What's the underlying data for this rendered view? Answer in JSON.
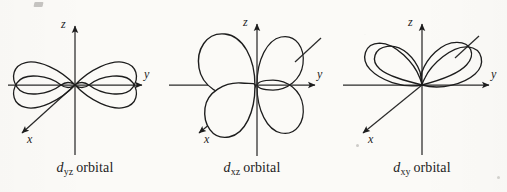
{
  "figure": {
    "kind": "d-orbital-shapes-diagram",
    "background_color": "#fbfaf7",
    "ink_color": "#1d1d1d",
    "panel_count": 3
  },
  "panels": [
    {
      "id": "dyz",
      "caption_symbol": "d",
      "caption_subscript": "yz",
      "caption_word": "orbital",
      "caption_full": "d yz orbital",
      "axes": [
        {
          "name": "z",
          "label": "z",
          "direction": "up",
          "arrow": true
        },
        {
          "name": "y",
          "label": "y",
          "direction": "right",
          "arrow": true
        },
        {
          "name": "x",
          "label": "x",
          "direction": "down-left",
          "arrow": true
        }
      ],
      "lobe_count": 4,
      "lobe_plane": "yz",
      "lobe_orientation": "diagonal between y and z axes"
    },
    {
      "id": "dxz",
      "caption_symbol": "d",
      "caption_subscript": "xz",
      "caption_word": "orbital",
      "caption_full": "d xz orbital",
      "axes": [
        {
          "name": "z",
          "label": "z",
          "direction": "up",
          "arrow": true
        },
        {
          "name": "y",
          "label": "y",
          "direction": "right",
          "arrow": true
        },
        {
          "name": "x",
          "label": "x",
          "direction": "down-left",
          "arrow": true
        }
      ],
      "lobe_count": 4,
      "lobe_plane": "xz",
      "lobe_orientation": "diagonal between x and z axes, two lobes front two behind"
    },
    {
      "id": "dxy",
      "caption_symbol": "d",
      "caption_subscript": "xy",
      "caption_word": "orbital",
      "caption_full": "d xy orbital",
      "axes": [
        {
          "name": "z",
          "label": "z",
          "direction": "up",
          "arrow": true
        },
        {
          "name": "y",
          "label": "y",
          "direction": "right",
          "arrow": true
        },
        {
          "name": "x",
          "label": "x",
          "direction": "down-left",
          "arrow": true
        }
      ],
      "lobe_count": 4,
      "lobe_plane": "xy",
      "lobe_orientation": "diagonal between x and y axes, drawn in perspective"
    }
  ]
}
